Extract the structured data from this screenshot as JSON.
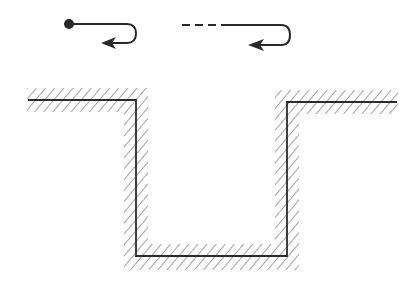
{
  "colors": {
    "background": "#ffffff",
    "stroke": "#2a2a2a",
    "hatch": "#7a7a7a"
  },
  "legend": {
    "items": [
      {
        "name": "solid-path-with-start-point",
        "style": "solid",
        "start_marker": "filled-dot",
        "end_marker": "arrow-left"
      },
      {
        "name": "dashed-then-solid-path",
        "style": "dashed-to-solid",
        "start_marker": "none",
        "end_marker": "arrow-left"
      }
    ]
  },
  "profile": {
    "description": "Cross-section of a rectangular trench/channel with hatched boundary surface",
    "points": [
      [
        28,
        100
      ],
      [
        136,
        100
      ],
      [
        136,
        256
      ],
      [
        287,
        256
      ],
      [
        287,
        102
      ],
      [
        397,
        102
      ]
    ]
  }
}
